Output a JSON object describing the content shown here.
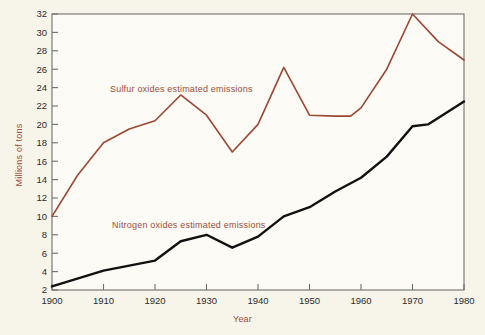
{
  "chart_data": {
    "type": "line",
    "title": "",
    "xlabel": "Year",
    "ylabel": "Millions of tons",
    "xlim": [
      1900,
      1980
    ],
    "ylim": [
      2,
      32
    ],
    "xticks": [
      1900,
      1910,
      1920,
      1930,
      1940,
      1950,
      1960,
      1970,
      1980
    ],
    "yticks": [
      2,
      4,
      6,
      8,
      10,
      12,
      14,
      16,
      18,
      20,
      22,
      24,
      26,
      28,
      30,
      32
    ],
    "grid": false,
    "legend_position": "inline-annotation",
    "series": [
      {
        "name": "Sulfur oxides estimated emissions",
        "color": "#9b4733",
        "annotation": "Sulfur oxides estimated emissions",
        "x": [
          1900,
          1905,
          1910,
          1915,
          1920,
          1925,
          1930,
          1935,
          1940,
          1945,
          1950,
          1955,
          1958,
          1960,
          1965,
          1970,
          1975,
          1980
        ],
        "y": [
          10.0,
          14.5,
          18.0,
          19.5,
          20.4,
          23.2,
          21.0,
          17.0,
          20.0,
          26.2,
          21.0,
          20.9,
          20.9,
          21.8,
          26.0,
          32.0,
          29.0,
          27.0
        ]
      },
      {
        "name": "Nitrogen oxides estimated emissions",
        "color": "#111111",
        "annotation": "Nitrogen oxides estimated emissions",
        "x": [
          1900,
          1910,
          1920,
          1925,
          1930,
          1935,
          1940,
          1945,
          1950,
          1955,
          1960,
          1965,
          1970,
          1973,
          1980
        ],
        "y": [
          2.4,
          4.1,
          5.2,
          7.3,
          8.0,
          6.6,
          7.8,
          10.0,
          11.0,
          12.7,
          14.2,
          16.5,
          19.8,
          20.0,
          22.5
        ]
      }
    ]
  },
  "axis": {
    "y_tick_labels": [
      "32",
      "30",
      "28",
      "26",
      "24",
      "22",
      "20",
      "18",
      "16",
      "14",
      "12",
      "10",
      "8",
      "6",
      "4",
      "2"
    ],
    "x_tick_labels": [
      "1900",
      "1910",
      "1920",
      "1930",
      "1940",
      "1950",
      "1960",
      "1970",
      "1980"
    ]
  },
  "annotations": {
    "sulfur": "Sulfur oxides estimated emissions",
    "nitrogen": "Nitrogen oxides estimated emissions"
  },
  "colors": {
    "sulfur_line": "#9b4733",
    "nitrogen_line": "#111111",
    "axis_title": "#a14b38",
    "frame": "#6f6f6f",
    "background": "#f7f5ea",
    "plot_background": "#fcfbf6"
  }
}
